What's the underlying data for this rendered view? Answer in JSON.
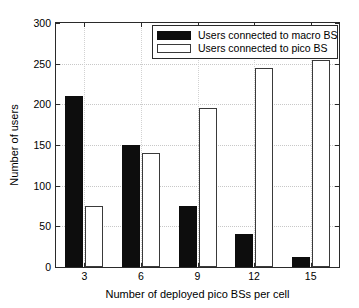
{
  "chart_data": {
    "type": "bar",
    "title": "",
    "xlabel": "Number of deployed pico BSs per cell",
    "ylabel": "Number of users",
    "categories": [
      "3",
      "6",
      "9",
      "12",
      "15"
    ],
    "series": [
      {
        "name": "Users connected to macro BS",
        "color": "#0d0d0d",
        "fill": "solid",
        "values": [
          210,
          150,
          75,
          40,
          12
        ]
      },
      {
        "name": "Users connected to pico BS",
        "color": "#ffffff",
        "fill": "outline",
        "values": [
          75,
          140,
          195,
          245,
          255
        ]
      }
    ],
    "ylim": [
      0,
      300
    ],
    "yticks": [
      0,
      50,
      100,
      150,
      200,
      250,
      300
    ],
    "ytick_labels": [
      "0",
      "50",
      "100",
      "150",
      "200",
      "250",
      "300"
    ],
    "xtick_labels": [
      "3",
      "6",
      "9",
      "12",
      "15"
    ],
    "grid": true,
    "legend_position": "top-right"
  },
  "legend": {
    "items": [
      {
        "label": "Users connected to macro BS",
        "swatch": "macro"
      },
      {
        "label": "Users connected to pico BS",
        "swatch": "pico"
      }
    ]
  }
}
